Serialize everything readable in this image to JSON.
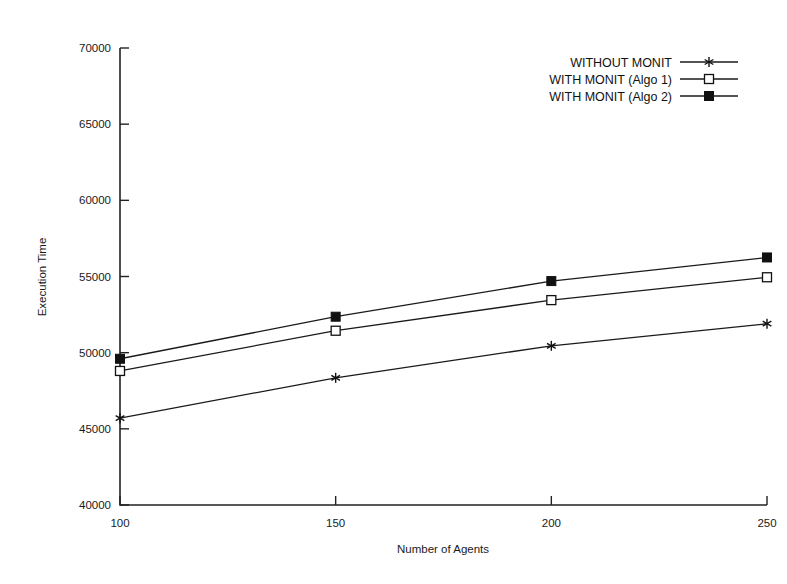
{
  "chart_data": {
    "type": "line",
    "title": "",
    "xlabel": "Number of Agents",
    "ylabel": "Execution Time",
    "x": [
      100,
      150,
      200,
      250
    ],
    "xtick_labels": [
      "100",
      "150",
      "200",
      "250"
    ],
    "ytick_labels": [
      "40000",
      "45000",
      "50000",
      "55000",
      "60000",
      "65000",
      "70000"
    ],
    "yticks": [
      40000,
      45000,
      50000,
      55000,
      60000,
      65000,
      70000
    ],
    "xlim": [
      100,
      250
    ],
    "ylim": [
      40000,
      70000
    ],
    "grid": false,
    "legend_position": "top-right",
    "series": [
      {
        "name": "WITHOUT MONIT",
        "marker": "star",
        "values": [
          45700,
          48350,
          50450,
          51900
        ]
      },
      {
        "name": "WITH MONIT (Algo 1)",
        "marker": "open-square",
        "values": [
          48800,
          51440,
          53450,
          54950
        ]
      },
      {
        "name": "WITH MONIT (Algo 2)",
        "marker": "filled-square",
        "values": [
          49600,
          52360,
          54700,
          56250
        ]
      }
    ]
  },
  "colors": {
    "line": "#1a1a1a",
    "axis": "#222222",
    "background": "#ffffff"
  }
}
